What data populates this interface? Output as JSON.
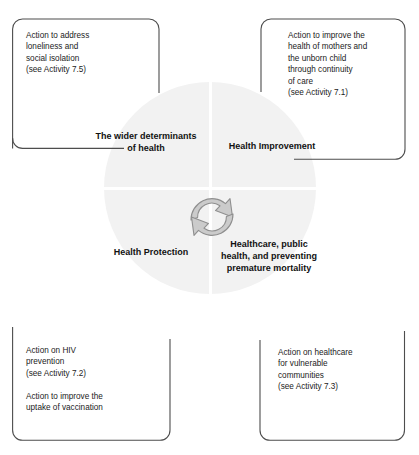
{
  "figure": {
    "caption_sliver": "",
    "circle": {
      "fill_color": "#f2f2f2",
      "divider_color": "#ffffff"
    },
    "quadrants": [
      {
        "id": "wider-determinants",
        "label": "The wider\ndeterminants of\nhealth",
        "position": "top-left"
      },
      {
        "id": "health-improvement",
        "label": "Health\nImprovement",
        "position": "top-right"
      },
      {
        "id": "health-protection",
        "label": "Health\nProtection",
        "position": "bottom-left"
      },
      {
        "id": "healthcare-public-health",
        "label": "Healthcare,\npublic health,\nand preventing\npremature\nmortality",
        "position": "bottom-right"
      }
    ],
    "center_icon": {
      "name": "cyclic-arrows-icon",
      "fill_color": "#cccccc",
      "stroke_color": "#8c8c8c"
    },
    "callouts": [
      {
        "id": "callout-loneliness",
        "position": "top-left",
        "text": "Action to address\nloneliness and\nsocial isolation\n(see Activity 7.5)",
        "text_second": ""
      },
      {
        "id": "callout-maternal-health",
        "position": "top-right",
        "text": "Action to improve the\nhealth of mothers and\nthe unborn child\nthrough continuity\nof care\n(see Activity 7.1)",
        "text_second": ""
      },
      {
        "id": "callout-hiv-vaccination",
        "position": "bottom-left",
        "text": "Action on HIV\nprevention\n(see Activity 7.2)",
        "text_second": "Action to improve the\nuptake of vaccination"
      },
      {
        "id": "callout-vulnerable-communities",
        "position": "bottom-right",
        "text": "Action on healthcare\nfor vulnerable\ncommunities\n(see Activity 7.3)",
        "text_second": ""
      }
    ],
    "colors": {
      "border": "#4d4d4d",
      "text": "#1b1b1b",
      "background": "#ffffff"
    }
  }
}
